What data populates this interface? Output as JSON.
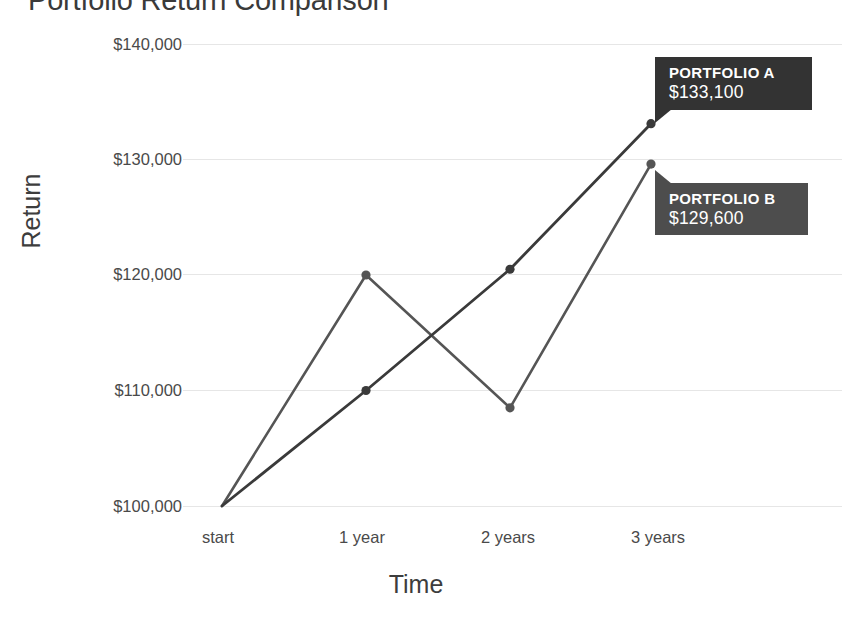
{
  "chart_data": {
    "type": "line",
    "title": "Portfolio Return Comparison",
    "xlabel": "Time",
    "ylabel": "Return",
    "categories": [
      "start",
      "1 year",
      "2 years",
      "3 years"
    ],
    "ytick_labels": [
      "$100,000",
      "$110,000",
      "$120,000",
      "$130,000",
      "$140,000"
    ],
    "ytick_values": [
      100000,
      110000,
      120000,
      130000,
      140000
    ],
    "ylim": [
      100000,
      140000
    ],
    "grid": true,
    "legend": "none",
    "series": [
      {
        "name": "Portfolio A",
        "color": "#3a3a3a",
        "values": [
          100000,
          110000,
          120500,
          133100
        ]
      },
      {
        "name": "Portfolio B",
        "color": "#555555",
        "values": [
          100000,
          120000,
          108500,
          129600
        ]
      }
    ],
    "annotations": [
      {
        "series": "Portfolio A",
        "name_label": "PORTFOLIO A",
        "value_label": "$133,100",
        "background": "#333333"
      },
      {
        "series": "Portfolio B",
        "name_label": "PORTFOLIO B",
        "value_label": "$129,600",
        "background": "#4d4d4d"
      }
    ]
  },
  "axes": {
    "y_title": "Return",
    "x_title": "Time",
    "y_ticks": [
      {
        "label": "$140,000"
      },
      {
        "label": "$130,000"
      },
      {
        "label": "$120,000"
      },
      {
        "label": "$110,000"
      },
      {
        "label": "$100,000"
      }
    ],
    "x_ticks": [
      {
        "label": "start"
      },
      {
        "label": "1 year"
      },
      {
        "label": "2 years"
      },
      {
        "label": "3 years"
      }
    ]
  },
  "tooltips": {
    "a": {
      "name": "PORTFOLIO A",
      "value": "$133,100"
    },
    "b": {
      "name": "PORTFOLIO B",
      "value": "$129,600"
    }
  },
  "header": {
    "title": "Portfolio Return Comparison"
  },
  "colors": {
    "series_a": "#3a3a3a",
    "series_b": "#555555",
    "grid": "#e6e6e6",
    "text": "#3d3d3d",
    "tooltip_a_bg": "#333333",
    "tooltip_b_bg": "#4d4d4d"
  }
}
